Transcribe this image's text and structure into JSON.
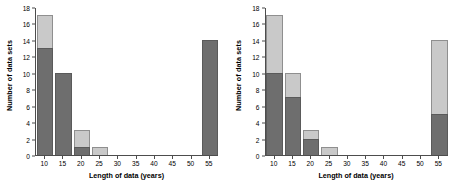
{
  "chart_data": [
    {
      "type": "bar",
      "title": "",
      "panel": "left",
      "xlabel": "Length of data (years)",
      "ylabel": "Number of data sets",
      "categories": [
        10,
        15,
        20,
        25,
        30,
        35,
        40,
        45,
        50,
        55
      ],
      "xticklabels": [
        "10",
        "15",
        "20",
        "25",
        "30",
        "35",
        "40",
        "45",
        "50",
        "55"
      ],
      "yticklabels": [
        "0",
        "2",
        "4",
        "6",
        "8",
        "10",
        "12",
        "14",
        "16",
        "18"
      ],
      "ylim": [
        0,
        18
      ],
      "xlim": [
        7.5,
        57.5
      ],
      "grid": false,
      "legend": "none",
      "stacked": true,
      "series": [
        {
          "name": "dark",
          "color": "#6e6e6e",
          "values": [
            13,
            10,
            1,
            0,
            0,
            0,
            0,
            0,
            0,
            14
          ]
        },
        {
          "name": "light",
          "color": "#c9c9c9",
          "values": [
            4,
            0,
            2,
            1,
            0,
            0,
            0,
            0,
            0,
            0
          ]
        }
      ],
      "totals": [
        17,
        10,
        3,
        1,
        0,
        0,
        0,
        0,
        0,
        14
      ]
    },
    {
      "type": "bar",
      "title": "",
      "panel": "right",
      "xlabel": "Length of data (years)",
      "ylabel": "Number of data sets",
      "categories": [
        10,
        15,
        20,
        25,
        30,
        35,
        40,
        45,
        50,
        55
      ],
      "xticklabels": [
        "10",
        "15",
        "20",
        "25",
        "30",
        "35",
        "40",
        "45",
        "50",
        "55"
      ],
      "yticklabels": [
        "0",
        "2",
        "4",
        "6",
        "8",
        "10",
        "12",
        "14",
        "16",
        "18"
      ],
      "ylim": [
        0,
        18
      ],
      "xlim": [
        7.5,
        57.5
      ],
      "grid": false,
      "legend": "none",
      "stacked": true,
      "series": [
        {
          "name": "dark",
          "color": "#6e6e6e",
          "values": [
            10,
            7,
            2,
            0,
            0,
            0,
            0,
            0,
            0,
            5
          ]
        },
        {
          "name": "light",
          "color": "#c9c9c9",
          "values": [
            7,
            3,
            1,
            1,
            0,
            0,
            0,
            0,
            0,
            9
          ]
        }
      ],
      "totals": [
        17,
        10,
        3,
        1,
        0,
        0,
        0,
        0,
        0,
        14
      ]
    }
  ],
  "colors": {
    "dark": "#6e6e6e",
    "light": "#c9c9c9",
    "axis": "#4d4d4d",
    "background": "#ffffff",
    "text": "#000000"
  }
}
